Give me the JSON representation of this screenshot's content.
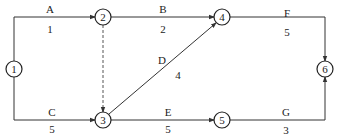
{
  "diagram": {
    "type": "activity-on-arrow network",
    "nodes": [
      {
        "id": "1",
        "label": "1",
        "x": 14,
        "y": 69
      },
      {
        "id": "2",
        "label": "2",
        "x": 103,
        "y": 17
      },
      {
        "id": "3",
        "label": "3",
        "x": 103,
        "y": 120
      },
      {
        "id": "4",
        "label": "4",
        "x": 222,
        "y": 17
      },
      {
        "id": "5",
        "label": "5",
        "x": 222,
        "y": 120
      },
      {
        "id": "6",
        "label": "6",
        "x": 325,
        "y": 69
      }
    ],
    "activities": [
      {
        "name": "A",
        "duration": "1",
        "from": "1",
        "to": "2"
      },
      {
        "name": "B",
        "duration": "2",
        "from": "2",
        "to": "4"
      },
      {
        "name": "C",
        "duration": "5",
        "from": "1",
        "to": "3"
      },
      {
        "name": "D",
        "duration": "4",
        "from": "3",
        "to": "4"
      },
      {
        "name": "E",
        "duration": "5",
        "from": "3",
        "to": "5"
      },
      {
        "name": "F",
        "duration": "5",
        "from": "4",
        "to": "6"
      },
      {
        "name": "G",
        "duration": "3",
        "from": "5",
        "to": "6"
      }
    ],
    "dummy_activities": [
      {
        "from": "2",
        "to": "3",
        "style": "dashed"
      }
    ]
  }
}
